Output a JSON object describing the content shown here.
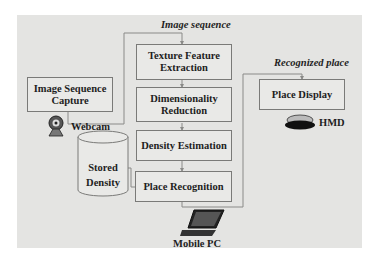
{
  "diagram": {
    "title_top": "Image sequence",
    "title_right": "Recognized place",
    "nodes": [
      {
        "id": "capture",
        "label": "Image Sequence\nCapture"
      },
      {
        "id": "texture",
        "label": "Texture Feature\nExtraction"
      },
      {
        "id": "dimred",
        "label": "Dimensionality\nReduction"
      },
      {
        "id": "density",
        "label": "Density Estimation"
      },
      {
        "id": "recog",
        "label": "Place Recognition"
      },
      {
        "id": "display",
        "label": "Place Display"
      },
      {
        "id": "stored",
        "label": "Stored\nDensity"
      }
    ],
    "devices": {
      "webcam": "Webcam",
      "hmd": "HMD",
      "mobile_pc": "Mobile PC"
    },
    "edges": [
      {
        "from": "capture",
        "to": "texture",
        "label": "Image sequence"
      },
      {
        "from": "texture",
        "to": "dimred"
      },
      {
        "from": "dimred",
        "to": "density"
      },
      {
        "from": "density",
        "to": "recog"
      },
      {
        "from": "stored",
        "to": "recog"
      },
      {
        "from": "recog",
        "to": "display",
        "label": "Recognized place"
      }
    ],
    "colors": {
      "panel": "#e4e4e2",
      "box": "#e9e9e7",
      "line": "#7a7a78",
      "text": "#1e1e1e"
    }
  }
}
